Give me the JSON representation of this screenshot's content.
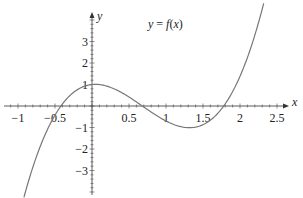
{
  "chart_data": {
    "type": "line",
    "title": "y = f(x)",
    "xlabel": "x",
    "ylabel": "y",
    "xlim": [
      -1.1,
      2.65
    ],
    "ylim": [
      -4.0,
      4.7
    ],
    "grid": false,
    "legend": null,
    "x_ticks": [
      -1,
      -0.5,
      0.5,
      1,
      1.5,
      2,
      2.5
    ],
    "x_tick_labels": [
      "−1",
      "−0.5",
      "0.5",
      "1",
      "1.5",
      "2",
      "2.5"
    ],
    "y_ticks": [
      3,
      2,
      1,
      -1,
      -2,
      -3
    ],
    "y_tick_labels": [
      "3",
      "2",
      "1",
      "−1",
      "−2",
      "−3"
    ],
    "annotations": [
      {
        "text": "y = f(x)",
        "x": 1.05,
        "y": 3.9
      }
    ],
    "series": [
      {
        "name": "f(x)",
        "description": "cubic with roots near -0.42, 0.68, 1.78; local max ~1 near x=0, local min ~-1.2 near x=1.3",
        "x": [
          -0.92,
          -0.8,
          -0.6,
          -0.42,
          -0.2,
          0,
          0.2,
          0.4,
          0.68,
          0.9,
          1.1,
          1.3,
          1.5,
          1.78,
          2.0,
          2.2,
          2.32
        ],
        "y": [
          -3.9,
          -2.9,
          -1.4,
          0,
          0.75,
          1.0,
          0.85,
          0.55,
          0,
          -0.55,
          -1.0,
          -1.2,
          -1.0,
          0,
          1.45,
          3.15,
          4.3
        ],
        "color": "#777777"
      }
    ]
  },
  "labels": {
    "title": "y = f(x)",
    "x_axis": "x",
    "y_axis": "y"
  }
}
